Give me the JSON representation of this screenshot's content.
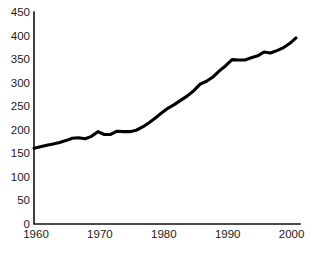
{
  "chart_data": {
    "type": "line",
    "title": "",
    "subtitle": "",
    "xlabel": "",
    "ylabel": "",
    "xlim": [
      1960,
      2001
    ],
    "ylim": [
      0,
      450
    ],
    "grid": false,
    "legend": null,
    "series_color": "#000000",
    "background_color": "#ffffff",
    "axis_color": "#111111",
    "y_ticks": [
      0,
      50,
      100,
      150,
      200,
      250,
      300,
      350,
      400,
      450
    ],
    "y_tick_labels": [
      "0",
      "50",
      "100",
      "150",
      "200",
      "250",
      "300",
      "350",
      "400",
      "450"
    ],
    "x_ticks": [
      1960,
      1970,
      1980,
      1990,
      2000
    ],
    "x_tick_labels": [
      "1960",
      "1970",
      "1980",
      "1990",
      "2000"
    ],
    "x": [
      1960,
      1961,
      1962,
      1963,
      1964,
      1965,
      1966,
      1967,
      1968,
      1969,
      1970,
      1971,
      1972,
      1973,
      1974,
      1975,
      1976,
      1977,
      1978,
      1979,
      1980,
      1981,
      1982,
      1983,
      1984,
      1985,
      1986,
      1987,
      1988,
      1989,
      1990,
      1991,
      1992,
      1993,
      1994,
      1995,
      1996,
      1997,
      1998,
      1999,
      2000,
      2001
    ],
    "series": [
      {
        "name": "series-1",
        "values": [
          161,
          164,
          167,
          170,
          173,
          177,
          182,
          183,
          181,
          186,
          196,
          190,
          190,
          197,
          196,
          196,
          199,
          206,
          215,
          225,
          236,
          246,
          254,
          263,
          272,
          283,
          297,
          303,
          312,
          325,
          336,
          349,
          348,
          348,
          353,
          357,
          365,
          363,
          368,
          374,
          383,
          395
        ]
      }
    ]
  }
}
